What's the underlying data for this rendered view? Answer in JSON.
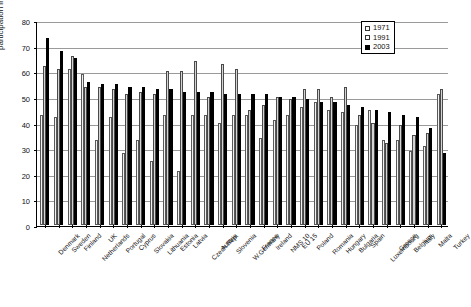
{
  "chart_data": {
    "type": "bar",
    "title": "",
    "xlabel": "",
    "ylabel": "participation in %",
    "ylim": [
      0,
      80
    ],
    "yticks": [
      0,
      10,
      20,
      30,
      40,
      50,
      60,
      70,
      80
    ],
    "grid": true,
    "legend_position": "top-right",
    "categories": [
      "Denmark",
      "Sweden",
      "Finland",
      "Netherlands",
      "UK",
      "Portugal",
      "Cyprus",
      "Slovakia",
      "Lithuania",
      "Estonia",
      "Latvia",
      "Czech Rep.",
      "Austria",
      "Slovenia",
      "W.Germany",
      "France",
      "Ireland",
      "NMS 10",
      "EU 15",
      "Poland",
      "Romania",
      "Hungary",
      "Bulgaria",
      "Spain",
      "Luxembourg",
      "Greece",
      "Belgium",
      "Italy",
      "Malta",
      "Turkey"
    ],
    "series": [
      {
        "name": "1971",
        "color": "#f2f2f2",
        "values": [
          43,
          42,
          61,
          59,
          33,
          42,
          28,
          33,
          25,
          43,
          21,
          43,
          43,
          40,
          43,
          43,
          34,
          41,
          43,
          46,
          48,
          45,
          44,
          39,
          45,
          33,
          33,
          29,
          31,
          51
        ]
      },
      {
        "name": "1991",
        "color": "#d4d4d4",
        "values": [
          62,
          61,
          66,
          54,
          54,
          53,
          51,
          52,
          51,
          60,
          60,
          64,
          50,
          63,
          61,
          45,
          47,
          50,
          49,
          53,
          53,
          50,
          54,
          43,
          40,
          32,
          39,
          35,
          36,
          53
        ]
      },
      {
        "name": "2003",
        "color": "#000000",
        "values": [
          73,
          68,
          65,
          56,
          55,
          55,
          54,
          54,
          53,
          53,
          52,
          52,
          52,
          51,
          51,
          51,
          51,
          50,
          50,
          49,
          48,
          48,
          47,
          46,
          45,
          44,
          43,
          42,
          38,
          28
        ]
      }
    ]
  },
  "legend": {
    "items": [
      {
        "label": "1971"
      },
      {
        "label": "1991"
      },
      {
        "label": "2003"
      }
    ]
  }
}
